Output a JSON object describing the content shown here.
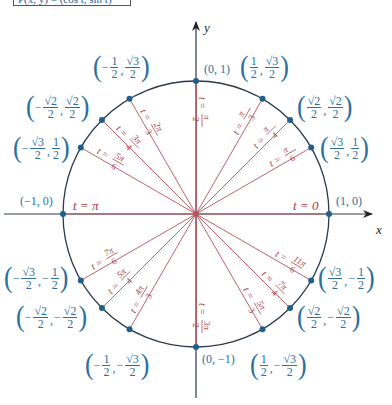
{
  "header_box": {
    "text": "P(x, y) = (cos t, sin t)"
  },
  "axes": {
    "x_label": "x",
    "y_label": "y"
  },
  "colors": {
    "circle": "#2a3a4a",
    "axis": "#222222",
    "ray": "#b5505a",
    "point": "#1f5f8b",
    "label_blue": "#2c6f9e",
    "label_red": "#a33a45"
  },
  "geometry": {
    "cx": 196,
    "cy": 214,
    "r": 133
  },
  "points": [
    {
      "angle_deg": 0,
      "t": "t = 0",
      "coord": "(1, 0)"
    },
    {
      "angle_deg": 30,
      "t_num": "π",
      "t_den": "6",
      "coord_x": "√3/2",
      "coord_y": "1/2"
    },
    {
      "angle_deg": 45,
      "t_num": "π",
      "t_den": "4",
      "coord_x": "√2/2",
      "coord_y": "√2/2"
    },
    {
      "angle_deg": 60,
      "t_num": "π",
      "t_den": "3",
      "coord_x": "1/2",
      "coord_y": "√3/2"
    },
    {
      "angle_deg": 90,
      "t_num": "π",
      "t_den": "2",
      "coord": "(0, 1)"
    },
    {
      "angle_deg": 120,
      "t_num": "2π",
      "t_den": "3",
      "coord_x": "-1/2",
      "coord_y": "√3/2"
    },
    {
      "angle_deg": 135,
      "t_num": "3π",
      "t_den": "4",
      "coord_x": "-√2/2",
      "coord_y": "√2/2"
    },
    {
      "angle_deg": 150,
      "t_num": "5π",
      "t_den": "6",
      "coord_x": "-√3/2",
      "coord_y": "1/2"
    },
    {
      "angle_deg": 180,
      "t": "t = π",
      "coord": "(−1, 0)"
    },
    {
      "angle_deg": 210,
      "t_num": "7π",
      "t_den": "6",
      "coord_x": "-√3/2",
      "coord_y": "-1/2"
    },
    {
      "angle_deg": 225,
      "t_num": "5π",
      "t_den": "4",
      "coord_x": "-√2/2",
      "coord_y": "-√2/2"
    },
    {
      "angle_deg": 240,
      "t_num": "4π",
      "t_den": "3",
      "coord_x": "-1/2",
      "coord_y": "-√3/2"
    },
    {
      "angle_deg": 270,
      "t_num": "3π",
      "t_den": "2",
      "coord": "(0, −1)"
    },
    {
      "angle_deg": 300,
      "t_num": "5π",
      "t_den": "3",
      "coord_x": "1/2",
      "coord_y": "-√3/2"
    },
    {
      "angle_deg": 315,
      "t_num": "7π",
      "t_den": "4",
      "coord_x": "√2/2",
      "coord_y": "-√2/2"
    },
    {
      "angle_deg": 330,
      "t_num": "11π",
      "t_den": "6",
      "coord_x": "√3/2",
      "coord_y": "-1/2"
    }
  ],
  "labels": {
    "c0": "(1, 0)",
    "c90": "(0, 1)",
    "c180": "(−1, 0)",
    "c270": "(0, −1)",
    "t0": "t = 0",
    "t180": "t = π",
    "one": "1",
    "two": "2",
    "r2": "√2",
    "r3": "√3",
    "minus": "−",
    "comma": ","
  }
}
